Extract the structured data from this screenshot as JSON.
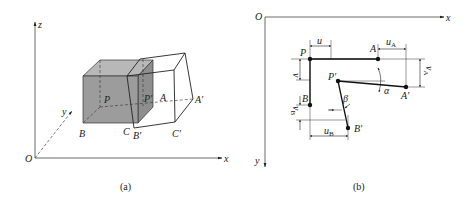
{
  "figure_a": {
    "caption": "(a)",
    "axes": {
      "origin": "O",
      "x": "x",
      "y": "y",
      "z": "z"
    },
    "points": {
      "P": "P",
      "P_prime": "P'",
      "A": "A",
      "A_prime": "A'",
      "B": "B",
      "B_prime": "B'",
      "C": "C",
      "C_prime": "C'"
    },
    "colors": {
      "cube_fill": "#9a9a9a",
      "line": "#222222"
    }
  },
  "figure_b": {
    "caption": "(b)",
    "axes": {
      "origin": "O",
      "x": "x",
      "y": "y"
    },
    "points": {
      "P": "P",
      "P_prime": "P'",
      "A": "A",
      "A_prime": "A'",
      "B": "B",
      "B_prime": "B'"
    },
    "dimensions": {
      "u": "u",
      "v": "v",
      "u_A": "u",
      "u_A_sub": "A",
      "v_A": "v",
      "v_A_sub": "A",
      "u_B": "u",
      "u_B_sub": "B",
      "v_B": "v",
      "v_B_sub": "B"
    },
    "angles": {
      "alpha": "α",
      "beta": "β"
    }
  }
}
